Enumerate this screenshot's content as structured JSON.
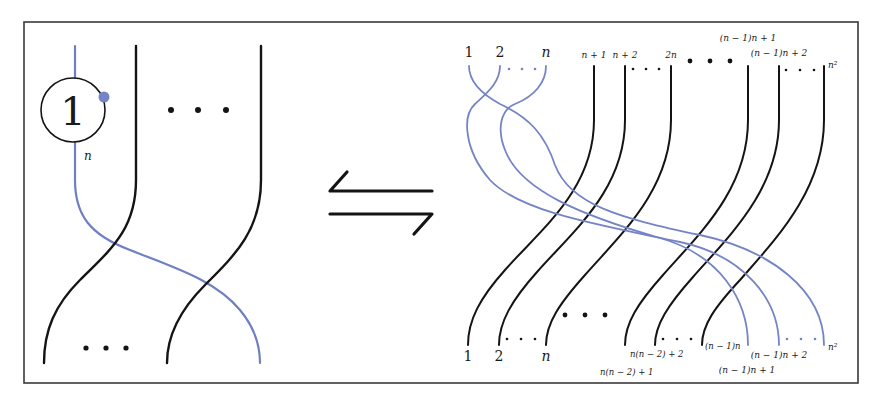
{
  "figure": {
    "colors": {
      "strand_black": "#141414",
      "strand_blue": "#6f7fc4",
      "frame": "#3a3a3a",
      "background": "#ffffff"
    },
    "left_panel": {
      "coupon_label": "1",
      "blue_strand_label": "n",
      "top_ellipsis": "• • •",
      "bottom_ellipsis": "• • •"
    },
    "relation_symbol": "⇋",
    "right_panel": {
      "top_labels": [
        {
          "text": "1",
          "color": "blue"
        },
        {
          "text": "2",
          "color": "blue"
        },
        {
          "text": "n",
          "color": "blue"
        },
        {
          "text": "n + 1",
          "color": "black"
        },
        {
          "text": "n + 2",
          "color": "black"
        },
        {
          "text": "2n",
          "color": "black"
        },
        {
          "text": "(n − 1)n + 1",
          "color": "black"
        },
        {
          "text": "(n − 1)n + 2",
          "color": "black"
        },
        {
          "text": "n²",
          "color": "black"
        }
      ],
      "bottom_labels": [
        {
          "text": "1",
          "color": "black"
        },
        {
          "text": "2",
          "color": "black"
        },
        {
          "text": "n",
          "color": "black"
        },
        {
          "text": "n(n − 2) + 1",
          "color": "black"
        },
        {
          "text": "n(n − 2) + 2",
          "color": "black"
        },
        {
          "text": "(n − 1)n",
          "color": "black"
        },
        {
          "text": "(n − 1)n + 1",
          "color": "blue"
        },
        {
          "text": "(n − 1)n + 2",
          "color": "blue"
        },
        {
          "text": "n²",
          "color": "blue"
        }
      ],
      "ellipsis": "· · ·",
      "big_ellipsis": "• • •"
    }
  }
}
